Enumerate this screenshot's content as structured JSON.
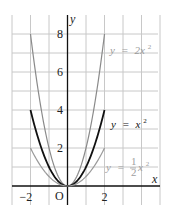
{
  "chart_data": {
    "type": "line",
    "title": "",
    "xlabel": "x",
    "ylabel": "y",
    "xlim": [
      -2,
      2
    ],
    "ylim": [
      0,
      8
    ],
    "grid": true,
    "origin_label": "O",
    "x_ticks": [
      {
        "value": -2,
        "label": "−2"
      },
      {
        "value": 2,
        "label": "2"
      }
    ],
    "y_ticks": [
      {
        "value": 2,
        "label": "2"
      },
      {
        "value": 4,
        "label": "4"
      },
      {
        "value": 6,
        "label": "6"
      },
      {
        "value": 8,
        "label": "8"
      }
    ],
    "series": [
      {
        "name": "y = 2x²",
        "coefficient": 2,
        "color": "#8a8a8a",
        "width": 1.2,
        "x": [
          -2,
          -1.5,
          -1,
          -0.5,
          0,
          0.5,
          1,
          1.5,
          2
        ],
        "values": [
          8,
          4.5,
          2,
          0.5,
          0,
          0.5,
          2,
          4.5,
          8
        ]
      },
      {
        "name": "y = x²",
        "coefficient": 1,
        "color": "#111111",
        "width": 1.8,
        "x": [
          -2,
          -1.5,
          -1,
          -0.5,
          0,
          0.5,
          1,
          1.5,
          2
        ],
        "values": [
          4,
          2.25,
          1,
          0.25,
          0,
          0.25,
          1,
          2.25,
          4
        ]
      },
      {
        "name": "y = ½x²",
        "coefficient": 0.5,
        "color": "#9a9a9a",
        "width": 1.2,
        "x": [
          -2,
          -1.5,
          -1,
          -0.5,
          0,
          0.5,
          1,
          1.5,
          2
        ],
        "values": [
          2,
          1.125,
          0.5,
          0.125,
          0,
          0.125,
          0.5,
          1.125,
          2
        ]
      }
    ],
    "annotations": [
      {
        "text": "y = 2x²",
        "series": 0,
        "lhs": "y",
        "eq": "=",
        "rhs": "2x",
        "sup": "2",
        "color": "#9a9a9a"
      },
      {
        "text": "y = x²",
        "series": 1,
        "lhs": "y",
        "eq": "=",
        "rhs": "x",
        "sup": "2",
        "color": "#111111"
      },
      {
        "text": "y = ½x²",
        "series": 2,
        "lhs": "y",
        "eq": "=",
        "num": "1",
        "den": "2",
        "rhs": "x",
        "sup": "2",
        "color": "#a0a0a0"
      }
    ]
  }
}
